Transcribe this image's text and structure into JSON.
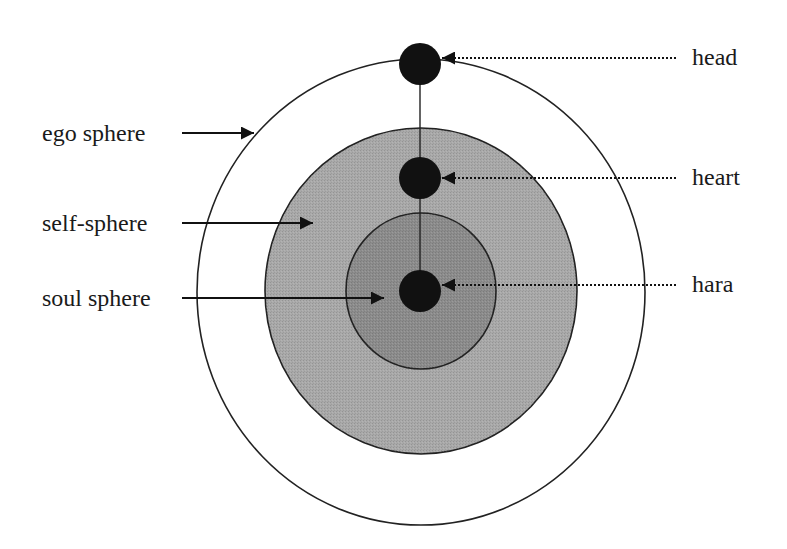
{
  "diagram": {
    "title": "",
    "colors": {
      "background": "#ffffff",
      "outline": "#222222",
      "ego_fill": "#ffffff",
      "self_fill": "#a9a9a9",
      "soul_fill": "#8c8c8c",
      "center_dots": "#111111"
    },
    "spheres": [
      {
        "id": "ego",
        "label": "ego sphere"
      },
      {
        "id": "self",
        "label": "self-sphere"
      },
      {
        "id": "soul",
        "label": "soul sphere"
      }
    ],
    "centers": [
      {
        "id": "head",
        "label": "head"
      },
      {
        "id": "heart",
        "label": "heart"
      },
      {
        "id": "hara",
        "label": "hara"
      }
    ]
  }
}
